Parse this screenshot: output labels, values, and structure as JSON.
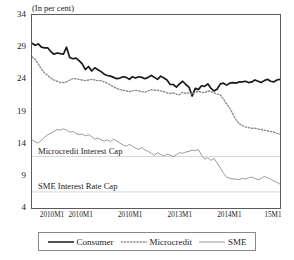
{
  "chart_data": {
    "type": "line",
    "title": "",
    "ylabel": "(In per cent)",
    "xlabel": "",
    "ylim": [
      4,
      34
    ],
    "yticks": [
      34,
      29,
      24,
      19,
      14,
      9,
      4
    ],
    "grid": false,
    "legend_position": "bottom",
    "x_tick_labels": [
      "2010M1",
      "2010M1",
      "2010M1",
      "2013M1",
      "2014M1",
      "15M1"
    ],
    "annotations": [
      {
        "text": "Microcredit Interest Cap",
        "value": 12.0
      },
      {
        "text": "SME Interest Rate Cap",
        "value": 6.5
      }
    ],
    "reference_lines": [
      12.0,
      6.5
    ],
    "series": [
      {
        "name": "Consumer",
        "style": "solid",
        "color": "#1a1a1a",
        "width": 1.7,
        "values": [
          29.6,
          29.3,
          29.5,
          29.0,
          28.9,
          28.9,
          28.3,
          27.9,
          28.1,
          28.0,
          27.9,
          29.0,
          27.4,
          27.2,
          27.3,
          26.9,
          26.4,
          25.5,
          26.0,
          25.3,
          25.8,
          25.5,
          25.2,
          24.8,
          24.6,
          24.5,
          24.3,
          24.1,
          24.2,
          24.4,
          24.3,
          24.0,
          24.4,
          24.2,
          24.4,
          24.3,
          24.1,
          24.3,
          24.6,
          24.3,
          24.0,
          24.5,
          24.2,
          23.9,
          23.2,
          23.2,
          22.8,
          23.3,
          23.7,
          23.2,
          22.8,
          21.4,
          22.6,
          22.4,
          23.0,
          22.9,
          23.3,
          22.6,
          22.2,
          22.5,
          23.3,
          23.4,
          23.1,
          23.4,
          23.5,
          23.4,
          23.6,
          23.6,
          23.7,
          23.5,
          23.6,
          23.9,
          23.7,
          23.5,
          23.8,
          24.0,
          23.7,
          23.6,
          23.9,
          24.0
        ]
      },
      {
        "name": "Microcredit",
        "style": "dotted",
        "color": "#8c8c8c",
        "width": 1.4,
        "values": [
          27.5,
          27.1,
          26.4,
          25.6,
          25.0,
          24.6,
          24.2,
          23.9,
          23.7,
          23.5,
          23.5,
          23.6,
          23.9,
          24.1,
          24.1,
          24.0,
          23.9,
          23.8,
          23.9,
          24.0,
          23.9,
          23.8,
          23.8,
          23.6,
          23.4,
          23.1,
          22.8,
          22.6,
          22.4,
          22.3,
          22.2,
          22.1,
          22.2,
          22.3,
          22.2,
          22.1,
          22.0,
          22.2,
          22.4,
          22.3,
          22.3,
          22.2,
          22.1,
          21.9,
          21.8,
          21.9,
          21.7,
          21.6,
          22.0,
          21.8,
          21.9,
          21.7,
          22.0,
          22.1,
          22.0,
          21.9,
          22.2,
          22.1,
          21.9,
          21.7,
          21.6,
          20.9,
          20.2,
          19.5,
          18.6,
          17.7,
          17.1,
          16.8,
          16.6,
          16.5,
          16.4,
          16.4,
          16.3,
          16.2,
          16.1,
          16.0,
          15.9,
          15.8,
          15.6,
          15.5
        ]
      },
      {
        "name": "SME",
        "style": "solid",
        "color": "#9a9a9a",
        "width": 1.0,
        "values": [
          14.6,
          14.3,
          14.1,
          14.5,
          15.0,
          15.4,
          15.6,
          15.9,
          16.2,
          16.1,
          16.3,
          16.1,
          15.8,
          15.9,
          15.6,
          15.4,
          15.5,
          15.2,
          15.4,
          15.1,
          14.7,
          14.9,
          14.6,
          14.4,
          14.6,
          14.3,
          14.7,
          14.4,
          14.1,
          13.8,
          13.6,
          13.9,
          13.6,
          13.3,
          13.1,
          13.4,
          13.0,
          12.8,
          12.5,
          12.2,
          12.6,
          12.3,
          12.1,
          12.4,
          12.2,
          12.0,
          12.3,
          12.6,
          12.5,
          12.7,
          12.8,
          13.0,
          12.9,
          13.1,
          12.2,
          11.6,
          11.8,
          11.4,
          11.7,
          11.0,
          10.2,
          9.4,
          8.8,
          8.6,
          8.5,
          8.5,
          8.4,
          8.6,
          8.5,
          8.7,
          8.8,
          8.6,
          8.4,
          8.6,
          8.9,
          8.7,
          8.5,
          8.2,
          8.0,
          7.7
        ]
      }
    ]
  },
  "legend": {
    "entries": [
      {
        "label": "Consumer",
        "icon": "solid-line-icon"
      },
      {
        "label": "Microcredit",
        "icon": "dotted-line-icon"
      },
      {
        "label": "SME",
        "icon": "thin-line-icon"
      }
    ]
  }
}
